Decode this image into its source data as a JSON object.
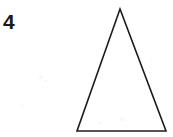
{
  "figure": {
    "label": "4",
    "caption": "",
    "width": 173,
    "height": 137,
    "background_color": "#ffffff",
    "ink_color": "#1b1b1b"
  },
  "diagram": {
    "shape_name": "isosceles-triangle",
    "shape_type": "triangle",
    "fill": "none",
    "stroke_color": "#1b1b1b",
    "stroke_width": 1.6,
    "vertices": [
      {
        "name": "apex",
        "x": 120,
        "y": 9
      },
      {
        "name": "bottom-right",
        "x": 166,
        "y": 131
      },
      {
        "name": "bottom-left",
        "x": 77,
        "y": 131
      }
    ],
    "points_attr": "120,9 166,131 77,131",
    "labels": []
  }
}
